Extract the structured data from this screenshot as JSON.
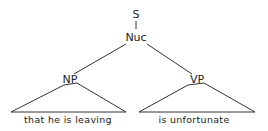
{
  "tree": {
    "root": {
      "label": "S"
    },
    "nucleus": {
      "label": "Nuc"
    },
    "left": {
      "label": "NP",
      "leaf_text": "that he is leaving"
    },
    "right": {
      "label": "VP",
      "leaf_text": "is unfortunate"
    }
  }
}
